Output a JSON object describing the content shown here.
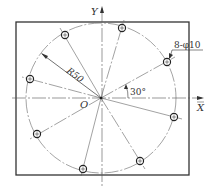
{
  "diagram": {
    "type": "bolt-hole-circle",
    "labels": {
      "x_axis": "X",
      "y_axis": "Y",
      "origin": "O",
      "radius": "R50",
      "angle": "30°",
      "holes_callout": "8-φ10"
    },
    "geometry": {
      "plate": {
        "x": 16,
        "y": 22,
        "width": 173,
        "height": 153
      },
      "center": {
        "x": 101,
        "y": 98
      },
      "circle_radius": 75,
      "hole_radius": 3.6,
      "holes": [
        {
          "x": 122,
          "y": 28
        },
        {
          "x": 65,
          "y": 35
        },
        {
          "x": 167,
          "y": 62
        },
        {
          "x": 30,
          "y": 79
        },
        {
          "x": 174,
          "y": 117
        },
        {
          "x": 37,
          "y": 134
        },
        {
          "x": 140,
          "y": 161
        },
        {
          "x": 83,
          "y": 169
        }
      ]
    },
    "colors": {
      "line": "#333333",
      "thin": "#555555"
    }
  }
}
